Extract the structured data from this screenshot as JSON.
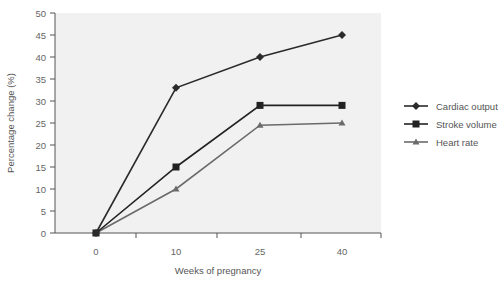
{
  "chart_data": {
    "type": "line",
    "title": "",
    "xlabel": "Weeks of pregnancy",
    "ylabel": "Percentage change (%)",
    "categories": [
      "0",
      "10",
      "25",
      "40"
    ],
    "ylim": [
      0,
      50
    ],
    "yticks": [
      0,
      5,
      10,
      15,
      20,
      25,
      30,
      35,
      40,
      45,
      50
    ],
    "grid": false,
    "legend_position": "right",
    "series": [
      {
        "name": "Cardiac output",
        "marker": "diamond",
        "color": "#2b2b2b",
        "values": [
          0,
          33,
          40,
          45
        ]
      },
      {
        "name": "Stroke volume",
        "marker": "square",
        "color": "#222222",
        "values": [
          0,
          15,
          29,
          29
        ]
      },
      {
        "name": "Heart rate",
        "marker": "triangle",
        "color": "#6b6b6b",
        "values": [
          0,
          10,
          24.5,
          25
        ]
      }
    ]
  },
  "colors": {
    "plot_background": "#f1f1f1",
    "axis": "#555555"
  }
}
